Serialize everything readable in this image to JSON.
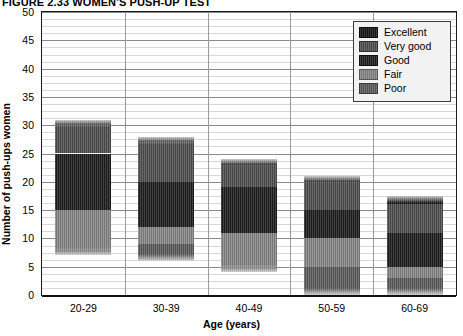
{
  "title": "FIGURE 2.33  WOMEN'S PUSH-UP TEST",
  "legend": {
    "position": "top-right",
    "items": [
      {
        "label": "Excellent",
        "color": "#151515"
      },
      {
        "label": "Very good",
        "color": "#4e4e4e"
      },
      {
        "label": "Good",
        "color": "#1d1d1d"
      },
      {
        "label": "Fair",
        "color": "#858585"
      },
      {
        "label": "Poor",
        "color": "#5a5a5a"
      }
    ]
  },
  "chart_data": {
    "type": "bar",
    "subtype": "stacked-bar",
    "title": "FIGURE 2.33  WOMEN'S PUSH-UP TEST",
    "xlabel": "Age (years)",
    "ylabel": "Number of push-ups women",
    "categories": [
      "20-29",
      "30-39",
      "40-49",
      "50-59",
      "60-69"
    ],
    "ylim": [
      0,
      50
    ],
    "yticks": [
      0,
      5,
      10,
      15,
      20,
      25,
      30,
      35,
      40,
      45,
      50
    ],
    "ytick_labels": [
      "0",
      "5",
      "10",
      "15",
      "20",
      "25",
      "30",
      "35",
      "40",
      "45",
      "50"
    ],
    "grid": true,
    "grid_major_step": 5,
    "grid_minor_step": 1.25,
    "legend_position": "top-right",
    "series": [
      {
        "name": "Excellent",
        "color": "#151515",
        "boundaries": [
          [
            30,
            31
          ],
          [
            27,
            28
          ],
          [
            23,
            24
          ],
          [
            20,
            21
          ],
          [
            16,
            17.5
          ]
        ],
        "values": [
          1,
          1,
          1,
          1,
          1.5
        ]
      },
      {
        "name": "Very good",
        "color": "#4e4e4e",
        "boundaries": [
          [
            25,
            30
          ],
          [
            20,
            27
          ],
          [
            19,
            23
          ],
          [
            15,
            20
          ],
          [
            11,
            16
          ]
        ],
        "values": [
          5,
          7,
          4,
          5,
          5
        ]
      },
      {
        "name": "Good",
        "color": "#1d1d1d",
        "boundaries": [
          [
            15,
            25
          ],
          [
            12,
            20
          ],
          [
            11,
            19
          ],
          [
            10,
            15
          ],
          [
            5,
            11
          ]
        ],
        "values": [
          10,
          8,
          8,
          5,
          6
        ]
      },
      {
        "name": "Fair",
        "color": "#858585",
        "boundaries": [
          [
            8,
            15
          ],
          [
            9,
            12
          ],
          [
            5,
            11
          ],
          [
            5,
            10
          ],
          [
            3,
            5
          ]
        ],
        "values": [
          7,
          3,
          6,
          5,
          2
        ]
      },
      {
        "name": "Poor",
        "color": "#5a5a5a",
        "boundaries": [
          [
            7,
            8
          ],
          [
            6,
            9
          ],
          [
            4,
            5
          ],
          [
            0,
            5
          ],
          [
            0,
            3
          ]
        ],
        "values": [
          1,
          3,
          1,
          5,
          3
        ]
      }
    ],
    "bar_tops": [
      31,
      28,
      24,
      21,
      17.5
    ],
    "bar_bottoms": [
      7,
      6,
      4,
      0,
      0
    ]
  }
}
